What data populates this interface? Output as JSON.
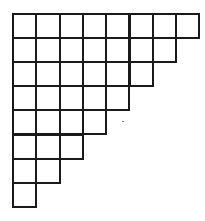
{
  "diagram": {
    "type": "staircase-grid",
    "rows": [
      8,
      7,
      6,
      5,
      4,
      3,
      2,
      1
    ],
    "origin": {
      "x": 13,
      "y": 14
    },
    "cell_width": 23.3,
    "cell_height": 24.1,
    "line_color": "#1a1a1a",
    "background_color": "#ffffff"
  },
  "artifacts": [
    {
      "type": "stray-dot",
      "x": 122,
      "y": 121
    }
  ]
}
